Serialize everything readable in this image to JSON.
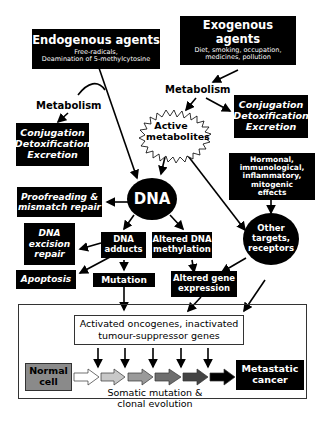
{
  "diagram": {
    "endogenous": {
      "title": "Endogenous agents",
      "line1": "Free-radicals,",
      "line2": "Deamination of 5-methylcytosine"
    },
    "exogenous": {
      "title_line1": "Exogenous",
      "title_line2": "agents",
      "line1": "Diet, smoking, occupation,",
      "line2": "medicines, pollution"
    },
    "metabolism_left": "Metabolism",
    "metabolism_right": "Metabolism",
    "conjugation_left": {
      "l1": "Conjugation",
      "l2": "Detoxification",
      "l3": "Excretion"
    },
    "conjugation_right": {
      "l1": "Conjugation",
      "l2": "Detoxification",
      "l3": "Excretion"
    },
    "active_metabolites": {
      "l1": "Active",
      "l2": "metabolites"
    },
    "hormonal": {
      "l1": "Hormonal,",
      "l2": "immunological,",
      "l3": "inflammatory,",
      "l4": "mitogenic",
      "l5": "effects"
    },
    "dna": "DNA",
    "proofreading": {
      "l1": "Proofreading &",
      "l2": "mismatch repair"
    },
    "dna_excision": {
      "l1": "DNA",
      "l2": "excision",
      "l3": "repair"
    },
    "dna_adducts": {
      "l1": "DNA",
      "l2": "adducts"
    },
    "altered_methylation": {
      "l1": "Altered DNA",
      "l2": "methylation"
    },
    "other_targets": {
      "l1": "Other",
      "l2": "targets,",
      "l3": "receptors"
    },
    "apoptosis": "Apoptosis",
    "mutation": "Mutation",
    "altered_gene": {
      "l1": "Altered gene",
      "l2": "expression"
    },
    "oncogenes": {
      "l1": "Activated oncogenes, inactivated",
      "l2": "tumour-suppressor genes"
    },
    "normal_cell": {
      "l1": "Normal",
      "l2": "cell"
    },
    "metastatic": {
      "l1": "Metastatic",
      "l2": "cancer"
    },
    "somatic": {
      "l1": "Somatic mutation &",
      "l2": "clonal evolution"
    },
    "colors": {
      "box": "#000000",
      "normal_cell": "#8a8a8a",
      "progression": [
        "#ffffff",
        "#c8c8c8",
        "#9a9a9a",
        "#6e6e6e",
        "#444444",
        "#000000"
      ]
    }
  }
}
